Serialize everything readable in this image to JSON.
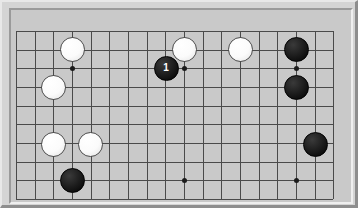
{
  "app": {
    "title": "Go Board Diagram",
    "board_type": "go-goban"
  },
  "board": {
    "background_color": "#c9c9c9",
    "frame_color": "#d4d4d4",
    "line_color": "#4a4a4a",
    "star_color": "#1a1a1a",
    "black_stone_color": "#1a1a1a",
    "white_stone_color": "#ffffff",
    "stone_diameter": 25,
    "cell_size": 18.67,
    "origin_x": 16,
    "origin_y": 31,
    "columns": 18,
    "rows": 10,
    "vertical_lines": [
      16,
      34.7,
      53.3,
      72,
      90.7,
      109.3,
      128,
      146.7,
      165.3,
      184,
      202.7,
      221.3,
      240,
      258.7,
      277.3,
      296,
      314.7,
      333.3
    ],
    "horizontal_lines": [
      31,
      49.7,
      68.3,
      87,
      105.7,
      124.3,
      143,
      161.7,
      180.3,
      199
    ],
    "star_points": [
      {
        "name": "star-point-upper-left",
        "x": 72,
        "y": 68
      },
      {
        "name": "star-point-upper-center",
        "x": 184,
        "y": 68
      },
      {
        "name": "star-point-upper-right",
        "x": 296,
        "y": 68
      },
      {
        "name": "star-point-lower-center",
        "x": 184,
        "y": 180
      },
      {
        "name": "star-point-lower-right",
        "x": 296,
        "y": 180
      }
    ],
    "stones": [
      {
        "id": "white-stone-1",
        "color": "white",
        "x": 72,
        "y": 49,
        "label": ""
      },
      {
        "id": "white-stone-2",
        "color": "white",
        "x": 184,
        "y": 49,
        "label": ""
      },
      {
        "id": "white-stone-3",
        "color": "white",
        "x": 240,
        "y": 49,
        "label": ""
      },
      {
        "id": "white-stone-4",
        "color": "white",
        "x": 53,
        "y": 87,
        "label": ""
      },
      {
        "id": "white-stone-5",
        "color": "white",
        "x": 53,
        "y": 144,
        "label": ""
      },
      {
        "id": "white-stone-6",
        "color": "white",
        "x": 90,
        "y": 144,
        "label": ""
      },
      {
        "id": "black-stone-move-1",
        "color": "black",
        "x": 166,
        "y": 68,
        "label": "1"
      },
      {
        "id": "black-stone-2",
        "color": "black",
        "x": 296,
        "y": 49,
        "label": ""
      },
      {
        "id": "black-stone-3",
        "color": "black",
        "x": 296,
        "y": 87,
        "label": ""
      },
      {
        "id": "black-stone-4",
        "color": "black",
        "x": 315,
        "y": 144,
        "label": ""
      },
      {
        "id": "black-stone-5",
        "color": "black",
        "x": 72,
        "y": 180,
        "label": ""
      }
    ],
    "move_numbers": [
      {
        "number": "1",
        "color": "black",
        "x": 166,
        "y": 68
      }
    ]
  }
}
